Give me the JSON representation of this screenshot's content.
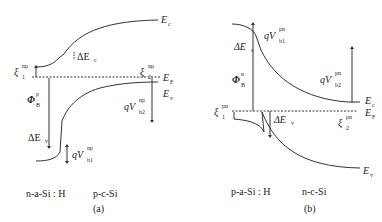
{
  "panels": [
    {
      "id": "a",
      "caption": "(a)",
      "left_material": "n-a-Si : H",
      "right_material": "p-c-Si",
      "labels": {
        "Ec": {
          "base": "E",
          "sub": "c"
        },
        "Ef": {
          "base": "E",
          "sub": "F"
        },
        "Ev": {
          "base": "E",
          "sub": "v"
        },
        "dEc": {
          "base": "ΔE",
          "sub": "c"
        },
        "dEv": {
          "base": "ΔE",
          "sub": "v"
        },
        "xi1": {
          "base": "ξ",
          "sup": "np",
          "sub": "1"
        },
        "xi2": {
          "base": "ξ",
          "sup": "np",
          "sub": "2"
        },
        "phiB": {
          "base": "Φ",
          "sup": "p",
          "sub": "B"
        },
        "qVb1": {
          "base": "qV",
          "sup": "np",
          "sub": "b1"
        },
        "qVb2": {
          "base": "qV",
          "sup": "np",
          "sub": "b2"
        }
      }
    },
    {
      "id": "b",
      "caption": "(b)",
      "left_material": "p-a-Si : H",
      "right_material": "n-c-Si",
      "labels": {
        "Ec": {
          "base": "E",
          "sub": "c"
        },
        "Ef": {
          "base": "E",
          "sub": "F"
        },
        "Ev": {
          "base": "E",
          "sub": "v"
        },
        "dEc": {
          "base": "ΔE",
          "sub": "c"
        },
        "dEv": {
          "base": "ΔE",
          "sub": "v"
        },
        "xi1": {
          "base": "ξ",
          "sup": "pn",
          "sub": "1"
        },
        "xi2": {
          "base": "ξ",
          "sup": "pn",
          "sub": "2"
        },
        "phiB": {
          "base": "Φ",
          "sup": "n",
          "sub": "B"
        },
        "qVb1": {
          "base": "qV",
          "sup": "pn",
          "sub": "b1"
        },
        "qVb2": {
          "base": "qV",
          "sup": "pn",
          "sub": "b2"
        }
      }
    }
  ]
}
